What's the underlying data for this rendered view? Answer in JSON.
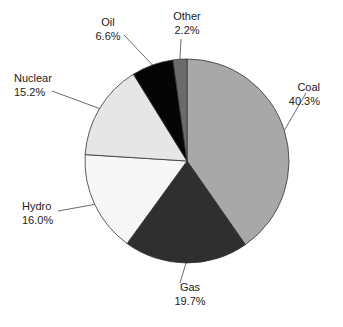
{
  "chart_data": {
    "type": "pie",
    "title": "",
    "categories": [
      "Coal",
      "Gas",
      "Hydro",
      "Nuclear",
      "Oil",
      "Other"
    ],
    "values": [
      40.3,
      19.7,
      16.0,
      15.2,
      6.6,
      2.2
    ],
    "value_labels": [
      "40.3%",
      "19.7%",
      "16.0%",
      "15.2%",
      "6.6%",
      "2.2%"
    ],
    "colors": [
      "#a8a8a8",
      "#2f2f2f",
      "#f7f7f7",
      "#e6e6e6",
      "#050505",
      "#6b6b6b"
    ],
    "start_angle_deg": 0,
    "direction": "clockwise from 12 o'clock",
    "legend": "none (callout labels with leader lines)"
  }
}
